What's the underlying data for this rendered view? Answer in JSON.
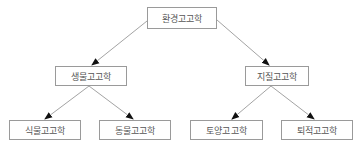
{
  "diagram": {
    "type": "tree",
    "title": "환경고고학",
    "nodes": [
      {
        "id": "root",
        "label": "환경고고학",
        "level": 0
      },
      {
        "id": "bio",
        "label": "생물고고학",
        "level": 1,
        "parent": "root"
      },
      {
        "id": "geo",
        "label": "지질고고학",
        "level": 1,
        "parent": "root"
      },
      {
        "id": "plant",
        "label": "식물고고학",
        "level": 2,
        "parent": "bio"
      },
      {
        "id": "animal",
        "label": "동물고고학",
        "level": 2,
        "parent": "bio"
      },
      {
        "id": "soil",
        "label": "토양고고학",
        "level": 2,
        "parent": "geo"
      },
      {
        "id": "sed",
        "label": "퇴적고고학",
        "level": 2,
        "parent": "geo"
      }
    ],
    "edges": [
      {
        "from": "root",
        "to": "bio"
      },
      {
        "from": "root",
        "to": "geo"
      },
      {
        "from": "bio",
        "to": "plant"
      },
      {
        "from": "bio",
        "to": "animal"
      },
      {
        "from": "geo",
        "to": "soil"
      },
      {
        "from": "geo",
        "to": "sed"
      }
    ],
    "colors": {
      "line": "#8c8c8c",
      "arrow": "#111111",
      "border": "#9a9a9a",
      "text": "#555555"
    }
  }
}
